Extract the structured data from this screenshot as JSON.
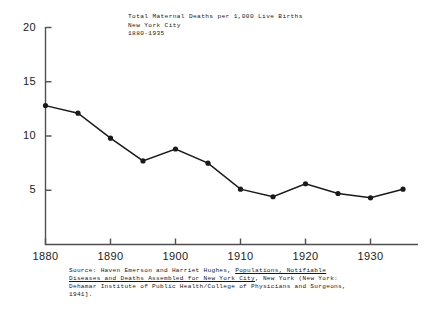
{
  "chart_data": {
    "type": "line",
    "title": "Total Maternal Deaths per 1,000 Live Births",
    "title_line2": "New York City",
    "title_line3": "1880-1935",
    "xlabel": "",
    "ylabel": "",
    "x": [
      1880,
      1885,
      1890,
      1895,
      1900,
      1905,
      1910,
      1915,
      1920,
      1925,
      1930,
      1935
    ],
    "values": [
      12.8,
      12.1,
      9.8,
      7.7,
      8.8,
      7.5,
      5.1,
      4.4,
      5.6,
      4.7,
      4.3,
      5.1
    ],
    "series": [
      {
        "name": "Total Maternal Deaths per 1,000 Live Births",
        "values": [
          12.8,
          12.1,
          9.8,
          7.7,
          8.8,
          7.5,
          5.1,
          4.4,
          5.6,
          4.7,
          4.3,
          5.1
        ]
      }
    ],
    "xlim": [
      1880,
      1936
    ],
    "ylim": [
      0,
      20
    ],
    "xticks": [
      1880,
      1890,
      1900,
      1910,
      1920,
      1930
    ],
    "xtick_labels": [
      "1880",
      "1890",
      "1900",
      "1910",
      "1920",
      "1930"
    ],
    "yticks": [
      5,
      10,
      15,
      20
    ],
    "ytick_labels": [
      "5",
      "10",
      "15",
      "20"
    ],
    "grid": false,
    "legend": "none",
    "line_color": "#1a1a1a",
    "marker": "circle",
    "marker_color": "#1a1a1a",
    "axis_color": "#4f4f4f"
  },
  "source": {
    "line1_prefix": "Source:  Haven Emerson and Harriet Hughes, ",
    "line1_italic": "Populations, Notifiable",
    "line2_italic": "Diseases and Deaths Assembled for New York City",
    "line2_suffix": ", New York (New York:",
    "line3": "Dehamar Institute of Public Health/College of Physicians and Surgeons,",
    "line4": "1941]."
  }
}
